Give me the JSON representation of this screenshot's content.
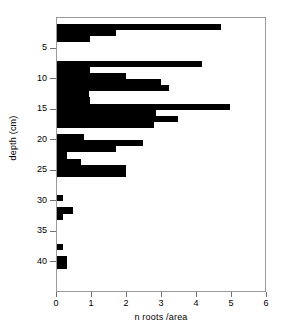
{
  "chart_data": {
    "type": "bar",
    "orientation": "horizontal",
    "title": "",
    "xlabel": "n roots /area",
    "ylabel": "depth (cm)",
    "xlim": [
      0,
      6
    ],
    "ylim": [
      0,
      45
    ],
    "y_inverted": true,
    "grid": false,
    "legend": null,
    "bar_color": "#000000",
    "xticks": [
      0,
      1,
      2,
      3,
      4,
      5,
      6
    ],
    "xtick_labels": [
      "0",
      "1",
      "2",
      "3",
      "4",
      "5",
      "6"
    ],
    "yticks": [
      5,
      10,
      15,
      20,
      25,
      30,
      35,
      40
    ],
    "ytick_labels": [
      "5",
      "10",
      "15",
      "20",
      "25",
      "30",
      "35",
      "40"
    ],
    "bin_width_cm": 1,
    "categories": [
      1,
      2,
      3,
      4,
      5,
      6,
      7,
      8,
      9,
      10,
      11,
      12,
      13,
      14,
      15,
      16,
      17,
      18,
      19,
      20,
      21,
      22,
      23,
      24,
      25,
      26,
      27,
      28,
      29,
      30,
      31,
      32,
      33,
      34,
      35,
      36,
      37,
      38,
      39,
      40,
      41
    ],
    "values": [
      0,
      4.68,
      1.68,
      0.95,
      0,
      0,
      0,
      4.15,
      0.95,
      1.98,
      2.98,
      3.2,
      0.9,
      0.95,
      4.95,
      2.82,
      3.45,
      2.78,
      0,
      0.78,
      2.45,
      1.68,
      0.28,
      0.68,
      1.98,
      1.98,
      0,
      0,
      0,
      0.16,
      0,
      0.45,
      0.16,
      0,
      0,
      0,
      0,
      0.18,
      0,
      0.28,
      0.28
    ]
  },
  "axes": {
    "y_title": "depth (cm)",
    "x_title": "n roots /area"
  }
}
